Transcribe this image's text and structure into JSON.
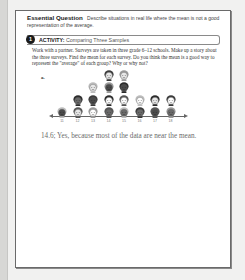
{
  "essential_question": {
    "title": "Essential Question",
    "text": "Describe situations in real life where the mean is not a good representation of the average."
  },
  "activity": {
    "number": "1",
    "label_bold": "ACTIVITY:",
    "label": "Comparing Three Samples"
  },
  "prompt": "Work with a partner. Surveys are taken in three grade 6–12 schools. Make up a story about the three surveys. Find the mean for each survey. Do you think the mean is a good way to represent the \"average\" of each group? Why or why not?",
  "part_label": "a.",
  "dot_plot": {
    "axis_ticks": [
      "11",
      "12",
      "13",
      "14",
      "15",
      "16",
      "17",
      "18"
    ],
    "counts": [
      1,
      2,
      3,
      4,
      4,
      2,
      2,
      2
    ]
  },
  "answer": "14.6; Yes, because most of the data are near the mean.",
  "colors": {
    "page_bg": "#ffffff",
    "outer_bg": "#f1f1f0",
    "answer_text": "#6b6b6b",
    "border": "#6a6a6a"
  },
  "chart_data": {
    "type": "scatter",
    "title": "",
    "xlabel": "",
    "ylabel": "",
    "categories": [
      "11",
      "12",
      "13",
      "14",
      "15",
      "16",
      "17",
      "18"
    ],
    "values": [
      1,
      2,
      3,
      4,
      4,
      2,
      2,
      2
    ],
    "note": "Pictograph dot plot; each face = one data point",
    "xlim": [
      11,
      18
    ],
    "grid": false
  }
}
